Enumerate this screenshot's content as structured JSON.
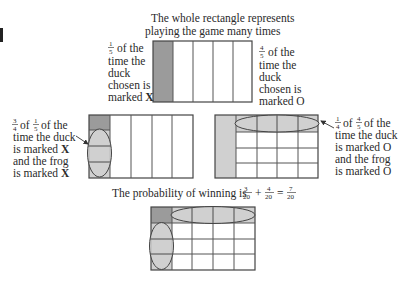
{
  "title": {
    "line1": "The whole rectangle represents",
    "line2": "playing the game many times"
  },
  "top_left_note": {
    "fraction": {
      "num": "1",
      "den": "5"
    },
    "lines": [
      "of the",
      "time the",
      "duck",
      "chosen is",
      "marked"
    ],
    "mark": "X"
  },
  "top_right_note": {
    "fraction": {
      "num": "4",
      "den": "5"
    },
    "lines": [
      "of the",
      "time the",
      "duck",
      "chosen is",
      "marked"
    ],
    "mark": "O"
  },
  "mid_left_note": {
    "fraction1": {
      "num": "3",
      "den": "4"
    },
    "of1": "of",
    "fraction2": {
      "num": "1",
      "den": "5"
    },
    "of2": "of the",
    "lines": [
      "time the duck",
      "is marked",
      "and the frog",
      "is marked"
    ],
    "marks": [
      "X",
      "X"
    ]
  },
  "mid_right_note": {
    "fraction1": {
      "num": "1",
      "den": "4"
    },
    "of1": "of",
    "fraction2": {
      "num": "4",
      "den": "5"
    },
    "of2": "of the",
    "lines": [
      "time the duck",
      "is marked",
      "and the frog",
      "is marked"
    ],
    "marks": [
      "O",
      "O"
    ]
  },
  "probability": {
    "prefix": "The probability of winning is",
    "term1": {
      "num": "3",
      "den": "20"
    },
    "plus": "+",
    "term2": {
      "num": "4",
      "den": "20"
    },
    "equals": "=",
    "result": {
      "num": "7",
      "den": "20"
    }
  },
  "colors": {
    "dark_shade": "#9b9b9b",
    "light_shade": "#d0d0d0",
    "line": "#555555",
    "text": "#2a2a2a"
  },
  "grid": {
    "columns": 5,
    "rows": 4
  }
}
